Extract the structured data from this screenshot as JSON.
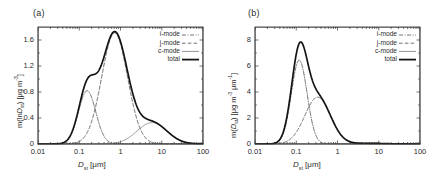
{
  "figure": {
    "background": "#ffffff",
    "panels": [
      {
        "tag": "(a)",
        "ylabel_prefix": "m(ln",
        "ylabel_var": "D",
        "ylabel_sub": "st",
        "ylabel_suffix": ") [μg m",
        "ylabel_exp": "-3",
        "ylabel_end": "]",
        "xlabel_var": "D",
        "xlabel_sub": "st",
        "xlabel_unit": "[μm]"
      },
      {
        "tag": "(b)",
        "ylabel_prefix": "m(",
        "ylabel_var": "D",
        "ylabel_sub": "st",
        "ylabel_suffix": ") [μg m",
        "ylabel_exp": "-3",
        "ylabel_mid": " μm",
        "ylabel_exp2": "-1",
        "ylabel_end": "]",
        "xlabel_var": "D",
        "xlabel_sub": "st",
        "xlabel_unit": "[μm]"
      }
    ],
    "legend": {
      "entries": [
        {
          "label": "i-mode",
          "style": "dash-dot",
          "color": "#4f4f4f",
          "width": 0.8
        },
        {
          "label": "j-mode",
          "style": "dashed",
          "color": "#4f4f4f",
          "width": 0.8
        },
        {
          "label": "c-mode",
          "style": "solid",
          "color": "#7a7a7a",
          "width": 0.8
        },
        {
          "label": "total",
          "style": "solid",
          "color": "#141414",
          "width": 1.8
        }
      ]
    },
    "colors": {
      "axis": "#3a3a3a",
      "total": "#141414",
      "i_mode": "#4f4f4f",
      "j_mode": "#4f4f4f",
      "c_mode": "#7a7a7a",
      "text": "#2b2b2b"
    }
  },
  "chart_data": [
    {
      "type": "line",
      "title": "(a)",
      "xlabel": "D_st [μm]",
      "ylabel": "m(lnD_st) [μg m^-3]",
      "xscale": "log",
      "xlim": [
        0.01,
        100
      ],
      "ylim": [
        0,
        1.8
      ],
      "xticks": [
        "0.01",
        "0.1",
        "1",
        "10",
        "100"
      ],
      "xtick_values": [
        0.01,
        0.1,
        1,
        10,
        100
      ],
      "yticks": [
        "0",
        "0.4",
        "0.8",
        "1.2",
        "1.6"
      ],
      "ytick_values": [
        0,
        0.4,
        0.8,
        1.2,
        1.6
      ],
      "grid": false,
      "legend_position": "top-right",
      "series": [
        {
          "name": "i-mode",
          "style": "dash-dot",
          "mode": "lognormal",
          "amplitude": 0.82,
          "median": 0.155,
          "sigma_g": 1.62,
          "peak_value": 0.82,
          "peak_x": 0.155
        },
        {
          "name": "j-mode",
          "style": "dashed",
          "mode": "lognormal",
          "amplitude": 1.71,
          "median": 0.72,
          "sigma_g": 2.05,
          "peak_value": 1.71,
          "peak_x": 0.72
        },
        {
          "name": "c-mode",
          "style": "solid",
          "mode": "lognormal",
          "amplitude": 0.33,
          "median": 5.8,
          "sigma_g": 2.3,
          "peak_value": 0.33,
          "peak_x": 5.8
        },
        {
          "name": "total",
          "style": "solid-thick",
          "mode": "sum",
          "peak_value": 1.73,
          "peak_x": 0.72,
          "shoulder_value": 1.2,
          "shoulder_x": 0.17
        }
      ]
    },
    {
      "type": "line",
      "title": "(b)",
      "xlabel": "D_st [μm]",
      "ylabel": "m(D_st) [μg m^-3 μm^-1]",
      "xscale": "log",
      "xlim": [
        0.01,
        100
      ],
      "ylim": [
        0,
        9
      ],
      "xticks": [
        "0.01",
        "0.1",
        "1",
        "10",
        "100"
      ],
      "xtick_values": [
        0.01,
        0.1,
        1,
        10,
        100
      ],
      "yticks": [
        "0",
        "2",
        "4",
        "6",
        "8"
      ],
      "ytick_values": [
        0,
        2,
        4,
        6,
        8
      ],
      "grid": false,
      "legend_position": "top-right",
      "series": [
        {
          "name": "i-mode",
          "style": "dash-dot",
          "mode": "lognormal",
          "amplitude": 6.45,
          "median": 0.118,
          "sigma_g": 1.55,
          "peak_value": 6.45,
          "peak_x": 0.118
        },
        {
          "name": "j-mode",
          "style": "dashed",
          "mode": "lognormal",
          "amplitude": 3.6,
          "median": 0.33,
          "sigma_g": 2.05,
          "peak_value": 3.6,
          "peak_x": 0.33
        },
        {
          "name": "c-mode",
          "style": "solid",
          "mode": "lognormal",
          "amplitude": 0.055,
          "median": 5.8,
          "sigma_g": 2.3,
          "peak_value": 0.055,
          "peak_x": 5.8
        },
        {
          "name": "total",
          "style": "solid-thick",
          "mode": "sum",
          "peak_value": 8.7,
          "peak_x": 0.12,
          "shoulder_value": 3.7,
          "shoulder_x": 0.36
        }
      ]
    }
  ]
}
